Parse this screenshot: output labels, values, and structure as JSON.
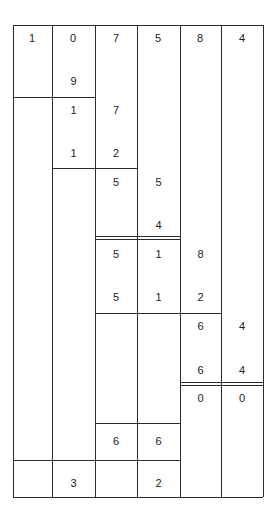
{
  "diagram": {
    "type": "long-multiplication-lattice",
    "columns_x": [
      13,
      52,
      95,
      137,
      180,
      221,
      263
    ],
    "table_top": 25,
    "table_bottom": 497,
    "header_row": [
      "1",
      "0",
      "7",
      "5",
      "8",
      "4"
    ],
    "cells": [
      {
        "id": "c1",
        "col": 1,
        "y": 81,
        "value": "9"
      },
      {
        "id": "c2",
        "col": 1,
        "y": 110,
        "value": "1"
      },
      {
        "id": "c3",
        "col": 2,
        "y": 110,
        "value": "7"
      },
      {
        "id": "c4",
        "col": 1,
        "y": 153,
        "value": "1"
      },
      {
        "id": "c5",
        "col": 2,
        "y": 153,
        "value": "2"
      },
      {
        "id": "c6",
        "col": 2,
        "y": 182,
        "value": "5"
      },
      {
        "id": "c7",
        "col": 3,
        "y": 182,
        "value": "5"
      },
      {
        "id": "c8",
        "col": 3,
        "y": 225,
        "value": "4"
      },
      {
        "id": "c9",
        "col": 2,
        "y": 254,
        "value": "5"
      },
      {
        "id": "c10",
        "col": 3,
        "y": 254,
        "value": "1"
      },
      {
        "id": "c11",
        "col": 4,
        "y": 254,
        "value": "8"
      },
      {
        "id": "c12",
        "col": 2,
        "y": 297,
        "value": "5"
      },
      {
        "id": "c13",
        "col": 3,
        "y": 297,
        "value": "1"
      },
      {
        "id": "c14",
        "col": 4,
        "y": 297,
        "value": "2"
      },
      {
        "id": "c15",
        "col": 4,
        "y": 326,
        "value": "6"
      },
      {
        "id": "c16",
        "col": 5,
        "y": 326,
        "value": "4"
      },
      {
        "id": "c17",
        "col": 4,
        "y": 370,
        "value": "6"
      },
      {
        "id": "c18",
        "col": 5,
        "y": 370,
        "value": "4"
      },
      {
        "id": "c19",
        "col": 4,
        "y": 398,
        "value": "0"
      },
      {
        "id": "c20",
        "col": 5,
        "y": 398,
        "value": "0"
      },
      {
        "id": "c21",
        "col": 2,
        "y": 441,
        "value": "6"
      },
      {
        "id": "c22",
        "col": 3,
        "y": 441,
        "value": "6"
      },
      {
        "id": "c23",
        "col": 1,
        "y": 483,
        "value": "3"
      },
      {
        "id": "c24",
        "col": 3,
        "y": 483,
        "value": "2"
      }
    ],
    "hlines": [
      {
        "y": 97,
        "from_col": 0,
        "to_col": 2,
        "double": false
      },
      {
        "y": 168,
        "from_col": 1,
        "to_col": 3,
        "double": false
      },
      {
        "y": 237,
        "from_col": 2,
        "to_col": 4,
        "double": true
      },
      {
        "y": 313,
        "from_col": 2,
        "to_col": 5,
        "double": false
      },
      {
        "y": 383,
        "from_col": 4,
        "to_col": 6,
        "double": true
      },
      {
        "y": 423,
        "from_col": 2,
        "to_col": 4,
        "double": false
      },
      {
        "y": 460,
        "from_col": 0,
        "to_col": 4,
        "double": false
      }
    ]
  }
}
